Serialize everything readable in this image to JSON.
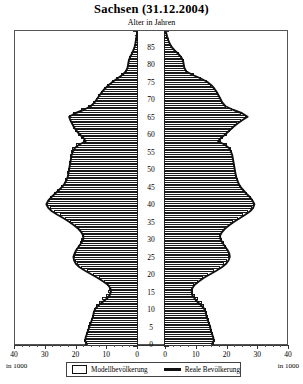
{
  "header": {
    "title": "Sachsen (31.12.2004)",
    "subtitle": "Alter in Jahren"
  },
  "axes": {
    "unit_left": "in 1000",
    "unit_right": "in 1000",
    "x_ticks_left": [
      "40",
      "30",
      "20",
      "10",
      "0"
    ],
    "x_ticks_right": [
      "0",
      "10",
      "20",
      "30",
      "40"
    ],
    "y_ticks": [
      "0",
      "5",
      "10",
      "15",
      "20",
      "25",
      "30",
      "35",
      "40",
      "45",
      "50",
      "55",
      "60",
      "65",
      "70",
      "75",
      "80",
      "85"
    ]
  },
  "legend": {
    "model_label": "Modellbevölkerung",
    "real_label": "Reale Bevölkerung"
  },
  "colors": {
    "model_fill": "#ffffff",
    "model_stroke": "#1a1a1a",
    "real_line": "#111111",
    "frame": "#555555"
  },
  "chart_data": {
    "type": "bar",
    "title": "Sachsen (31.12.2004)",
    "subtitle": "Alter in Jahren",
    "orientation": "population-pyramid",
    "xlabel": "in 1000",
    "ylabel": "Alter in Jahren",
    "xlim": [
      0,
      40
    ],
    "ylim": [
      0,
      89
    ],
    "grid": false,
    "legend_position": "bottom",
    "categories": [
      0,
      1,
      2,
      3,
      4,
      5,
      6,
      7,
      8,
      9,
      10,
      11,
      12,
      13,
      14,
      15,
      16,
      17,
      18,
      19,
      20,
      21,
      22,
      23,
      24,
      25,
      26,
      27,
      28,
      29,
      30,
      31,
      32,
      33,
      34,
      35,
      36,
      37,
      38,
      39,
      40,
      41,
      42,
      43,
      44,
      45,
      46,
      47,
      48,
      49,
      50,
      51,
      52,
      53,
      54,
      55,
      56,
      57,
      58,
      59,
      60,
      61,
      62,
      63,
      64,
      65,
      66,
      67,
      68,
      69,
      70,
      71,
      72,
      73,
      74,
      75,
      76,
      77,
      78,
      79,
      80,
      81,
      82,
      83,
      84,
      85,
      86,
      87,
      88,
      89
    ],
    "series": [
      {
        "name": "Modellbevölkerung männlich",
        "side": "left",
        "style": "bar",
        "values": [
          17.2,
          17.6,
          17.4,
          17.0,
          16.6,
          16.2,
          15.8,
          15.4,
          15.0,
          14.8,
          14.4,
          13.8,
          12.8,
          11.6,
          10.4,
          9.6,
          9.4,
          10.0,
          11.2,
          12.8,
          14.6,
          16.6,
          18.4,
          19.8,
          20.4,
          20.8,
          20.6,
          20.2,
          19.6,
          19.0,
          18.4,
          18.2,
          18.6,
          19.4,
          20.6,
          22.0,
          23.6,
          25.4,
          27.2,
          28.6,
          29.6,
          29.4,
          28.6,
          27.4,
          26.2,
          25.0,
          24.2,
          23.6,
          23.2,
          23.0,
          22.8,
          22.6,
          22.4,
          22.2,
          22.0,
          21.8,
          21.4,
          20.2,
          18.0,
          18.6,
          19.6,
          20.4,
          21.0,
          21.6,
          22.2,
          22.6,
          21.0,
          18.4,
          16.2,
          14.8,
          13.8,
          13.0,
          12.2,
          11.2,
          10.0,
          8.6,
          7.0,
          5.4,
          4.2,
          3.6,
          3.4,
          3.2,
          2.8,
          2.2,
          1.6,
          1.2,
          0.9,
          0.7,
          0.5,
          0.35
        ]
      },
      {
        "name": "Reale Bevölkerung männlich",
        "side": "left",
        "style": "line",
        "values": [
          16.6,
          17.2,
          17.0,
          16.6,
          16.2,
          15.8,
          15.4,
          15.0,
          14.6,
          14.4,
          14.0,
          13.0,
          11.6,
          10.2,
          9.2,
          8.8,
          9.0,
          9.8,
          11.4,
          13.2,
          15.2,
          17.2,
          19.0,
          20.2,
          20.8,
          21.0,
          20.6,
          20.0,
          19.2,
          18.4,
          17.8,
          17.8,
          18.4,
          19.4,
          20.8,
          22.4,
          24.2,
          26.2,
          28.0,
          29.2,
          29.8,
          29.2,
          28.2,
          27.0,
          25.8,
          24.6,
          23.8,
          23.2,
          22.8,
          22.6,
          22.4,
          22.2,
          22.0,
          21.8,
          21.6,
          21.2,
          20.6,
          19.2,
          17.0,
          17.8,
          19.0,
          20.0,
          20.8,
          21.4,
          22.0,
          22.4,
          20.4,
          17.6,
          15.4,
          14.2,
          13.4,
          12.6,
          11.8,
          10.8,
          9.6,
          8.2,
          6.6,
          5.0,
          3.9,
          3.4,
          3.2,
          3.0,
          2.6,
          2.0,
          1.5,
          1.1,
          0.85,
          0.65,
          0.45,
          0.3
        ]
      },
      {
        "name": "Modellbevölkerung weiblich",
        "side": "right",
        "style": "bar",
        "values": [
          16.2,
          16.6,
          16.4,
          16.0,
          15.6,
          15.4,
          15.0,
          14.6,
          14.2,
          14.0,
          13.6,
          13.0,
          12.2,
          11.0,
          10.0,
          9.4,
          9.2,
          9.8,
          11.0,
          12.6,
          14.4,
          16.4,
          18.2,
          19.6,
          20.6,
          21.2,
          21.0,
          20.6,
          20.0,
          19.4,
          18.8,
          18.6,
          19.0,
          19.8,
          21.0,
          22.4,
          24.0,
          25.8,
          27.4,
          28.6,
          29.2,
          29.0,
          28.2,
          27.0,
          26.0,
          25.0,
          24.4,
          24.0,
          23.6,
          23.4,
          23.2,
          23.0,
          22.8,
          22.6,
          22.4,
          22.2,
          21.8,
          20.6,
          18.4,
          19.2,
          20.4,
          21.4,
          22.4,
          23.6,
          25.0,
          26.6,
          25.0,
          22.2,
          20.0,
          19.0,
          18.4,
          17.8,
          17.2,
          16.4,
          15.4,
          14.0,
          12.0,
          9.6,
          7.6,
          6.8,
          6.6,
          6.4,
          5.8,
          4.8,
          3.6,
          2.6,
          2.0,
          1.5,
          1.1,
          0.8
        ]
      },
      {
        "name": "Reale Bevölkerung weiblich",
        "side": "right",
        "style": "line",
        "values": [
          15.6,
          16.2,
          16.0,
          15.6,
          15.2,
          15.0,
          14.6,
          14.2,
          13.8,
          13.6,
          13.2,
          12.2,
          11.0,
          10.0,
          9.2,
          9.0,
          9.2,
          10.0,
          11.4,
          13.0,
          15.0,
          17.0,
          18.8,
          20.2,
          21.0,
          21.4,
          21.2,
          20.6,
          19.8,
          19.0,
          18.4,
          18.2,
          18.8,
          19.8,
          21.2,
          22.8,
          24.6,
          26.4,
          28.0,
          29.0,
          29.4,
          28.8,
          28.0,
          26.8,
          25.8,
          24.8,
          24.2,
          23.8,
          23.4,
          23.2,
          23.0,
          22.8,
          22.6,
          22.4,
          22.2,
          21.8,
          21.2,
          19.8,
          17.6,
          18.6,
          20.0,
          21.2,
          22.4,
          23.8,
          25.4,
          27.2,
          25.4,
          22.4,
          20.0,
          19.0,
          18.4,
          17.8,
          17.2,
          16.4,
          15.4,
          14.0,
          11.8,
          9.2,
          7.2,
          6.6,
          6.4,
          6.2,
          5.6,
          4.6,
          3.4,
          2.4,
          1.8,
          1.35,
          1.0,
          0.7
        ]
      }
    ]
  }
}
